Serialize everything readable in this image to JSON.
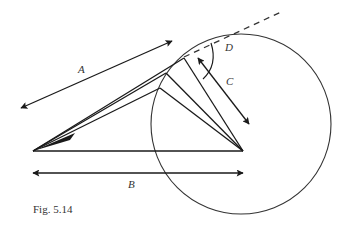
{
  "figure": {
    "caption": "Fig. 5.14",
    "labels": {
      "A": "A",
      "B": "B",
      "C": "C",
      "D": "D"
    },
    "colors": {
      "stroke": "#1a1a1a",
      "text": "#333333",
      "background": "#ffffff"
    }
  }
}
